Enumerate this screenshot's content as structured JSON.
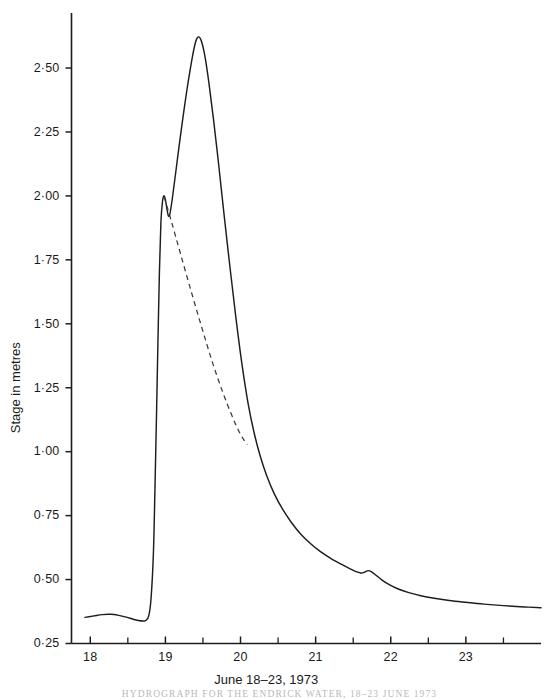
{
  "chart_data": {
    "type": "line",
    "title": "",
    "xlabel": "June 18–23, 1973",
    "ylabel": "Stage in metres",
    "xlim": [
      17.75,
      24.0
    ],
    "ylim": [
      0.25,
      2.68
    ],
    "grid": false,
    "legend": "none",
    "x_tick_labels": [
      "18",
      "19",
      "20",
      "21",
      "22",
      "23"
    ],
    "x_tick_values": [
      18,
      19,
      20,
      21,
      22,
      23
    ],
    "x_minor_tick_values": [
      18.5,
      19.5,
      20.5,
      21.5,
      22.5,
      23.5
    ],
    "y_tick_labels": [
      "0·25",
      "0·50",
      "0·75",
      "1·00",
      "1·25",
      "1·50",
      "1·75",
      "2·00",
      "2·25",
      "2·50"
    ],
    "y_tick_values": [
      0.25,
      0.5,
      0.75,
      1.0,
      1.25,
      1.5,
      1.75,
      2.0,
      2.25,
      2.5
    ],
    "series": [
      {
        "name": "stage-hydrograph",
        "style": "solid",
        "points": [
          [
            17.93,
            0.352
          ],
          [
            18.05,
            0.358
          ],
          [
            18.16,
            0.363
          ],
          [
            18.27,
            0.364
          ],
          [
            18.38,
            0.36
          ],
          [
            18.48,
            0.353
          ],
          [
            18.57,
            0.345
          ],
          [
            18.64,
            0.34
          ],
          [
            18.7,
            0.338
          ],
          [
            18.74,
            0.34
          ],
          [
            18.78,
            0.36
          ],
          [
            18.81,
            0.43
          ],
          [
            18.84,
            0.6
          ],
          [
            18.86,
            0.84
          ],
          [
            18.88,
            1.12
          ],
          [
            18.9,
            1.42
          ],
          [
            18.92,
            1.7
          ],
          [
            18.94,
            1.895
          ],
          [
            18.96,
            1.975
          ],
          [
            18.98,
            2.0
          ],
          [
            19.0,
            1.985
          ],
          [
            19.02,
            1.95
          ],
          [
            19.04,
            1.922
          ],
          [
            19.06,
            1.93
          ],
          [
            19.09,
            1.985
          ],
          [
            19.13,
            2.075
          ],
          [
            19.18,
            2.19
          ],
          [
            19.24,
            2.32
          ],
          [
            19.3,
            2.44
          ],
          [
            19.36,
            2.545
          ],
          [
            19.4,
            2.6
          ],
          [
            19.43,
            2.62
          ],
          [
            19.46,
            2.618
          ],
          [
            19.49,
            2.595
          ],
          [
            19.53,
            2.54
          ],
          [
            19.58,
            2.44
          ],
          [
            19.64,
            2.3
          ],
          [
            19.71,
            2.12
          ],
          [
            19.78,
            1.93
          ],
          [
            19.86,
            1.72
          ],
          [
            19.94,
            1.52
          ],
          [
            20.02,
            1.34
          ],
          [
            20.1,
            1.19
          ],
          [
            20.18,
            1.075
          ],
          [
            20.26,
            0.985
          ],
          [
            20.35,
            0.905
          ],
          [
            20.45,
            0.835
          ],
          [
            20.56,
            0.775
          ],
          [
            20.68,
            0.722
          ],
          [
            20.8,
            0.678
          ],
          [
            20.93,
            0.641
          ],
          [
            21.06,
            0.61
          ],
          [
            21.2,
            0.583
          ],
          [
            21.34,
            0.56
          ],
          [
            21.46,
            0.542
          ],
          [
            21.54,
            0.531
          ],
          [
            21.6,
            0.526
          ],
          [
            21.64,
            0.527
          ],
          [
            21.67,
            0.532
          ],
          [
            21.7,
            0.535
          ],
          [
            21.74,
            0.531
          ],
          [
            21.8,
            0.518
          ],
          [
            21.88,
            0.499
          ],
          [
            21.98,
            0.48
          ],
          [
            22.1,
            0.463
          ],
          [
            22.24,
            0.449
          ],
          [
            22.4,
            0.437
          ],
          [
            22.58,
            0.427
          ],
          [
            22.78,
            0.418
          ],
          [
            23.0,
            0.411
          ],
          [
            23.24,
            0.404
          ],
          [
            23.5,
            0.398
          ],
          [
            23.78,
            0.393
          ],
          [
            24.0,
            0.39
          ]
        ]
      },
      {
        "name": "inferred-recession",
        "style": "dashed",
        "points": [
          [
            18.985,
            1.995
          ],
          [
            19.08,
            1.9
          ],
          [
            19.2,
            1.775
          ],
          [
            19.34,
            1.63
          ],
          [
            19.48,
            1.49
          ],
          [
            19.62,
            1.355
          ],
          [
            19.76,
            1.235
          ],
          [
            19.88,
            1.145
          ],
          [
            19.97,
            1.085
          ],
          [
            20.04,
            1.048
          ],
          [
            20.09,
            1.028
          ]
        ]
      }
    ],
    "annotations": []
  },
  "caption": {
    "text": "HYDROGRAPH FOR THE ENDRICK WATER, 18–23 JUNE 1973"
  }
}
